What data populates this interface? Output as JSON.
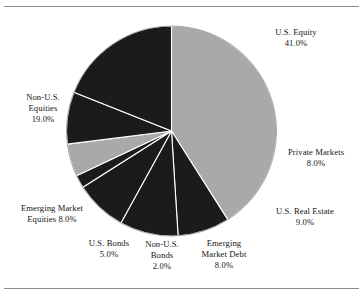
{
  "figure": {
    "name": "asset-allocation-pie-chart",
    "background_color": "#ffffff",
    "rule_color": "#8d8d8d"
  },
  "chart_data": {
    "type": "pie",
    "title": "",
    "subtitle": "",
    "xlabel": "",
    "ylabel": "",
    "legend_position": "none",
    "labels_placement": "outside-callout",
    "grid": false,
    "start_angle_deg": 0,
    "direction": "clockwise",
    "units": "percent",
    "total": 100.0,
    "categories": [
      "U.S. Equity",
      "Private Markets",
      "U.S. Real Estate",
      "Emerging Market Debt",
      "Non-U.S. Bonds",
      "U.S. Bonds",
      "Emerging Market Equities",
      "Non-U.S. Equities"
    ],
    "values": [
      41.0,
      8.0,
      9.0,
      8.0,
      2.0,
      5.0,
      8.0,
      19.0
    ],
    "value_labels": [
      "41.0%",
      "8.0%",
      "9.0%",
      "8.0%",
      "2.0%",
      "5.0%",
      "8.0%",
      "19.0%"
    ],
    "colors": [
      "#a9a9a9",
      "#1b1b1b",
      "#1b1b1b",
      "#1b1b1b",
      "#1b1b1b",
      "#a9a9a9",
      "#1b1b1b",
      "#1b1b1b"
    ],
    "slice_border_color": "#ffffff",
    "slices": [
      {
        "label": "U.S. Equity",
        "value": 41.0,
        "value_label": "41.0%",
        "color": "#a9a9a9",
        "label_lines": [
          "U.S. Equity",
          "41.0%"
        ]
      },
      {
        "label": "Private Markets",
        "value": 8.0,
        "value_label": "8.0%",
        "color": "#1b1b1b",
        "label_lines": [
          "Private Markets",
          "8.0%"
        ]
      },
      {
        "label": "U.S. Real Estate",
        "value": 9.0,
        "value_label": "9.0%",
        "color": "#1b1b1b",
        "label_lines": [
          "U.S. Real Estate",
          "9.0%"
        ]
      },
      {
        "label": "Emerging Market Debt",
        "value": 8.0,
        "value_label": "8.0%",
        "color": "#1b1b1b",
        "label_lines": [
          "Emerging",
          "Market Debt",
          "8.0%"
        ]
      },
      {
        "label": "Non-U.S. Bonds",
        "value": 2.0,
        "value_label": "2.0%",
        "color": "#1b1b1b",
        "label_lines": [
          "Non-U.S.",
          "Bonds",
          "2.0%"
        ]
      },
      {
        "label": "U.S. Bonds",
        "value": 5.0,
        "value_label": "5.0%",
        "color": "#a9a9a9",
        "label_lines": [
          "U.S. Bonds",
          "5.0%"
        ]
      },
      {
        "label": "Emerging Market Equities",
        "value": 8.0,
        "value_label": "8.0%",
        "color": "#1b1b1b",
        "label_lines": [
          "Emerging Market",
          "Equities 8.0%"
        ]
      },
      {
        "label": "Non-U.S. Equities",
        "value": 19.0,
        "value_label": "19.0%",
        "color": "#1b1b1b",
        "label_lines": [
          "Non-U.S.",
          "Equities",
          "19.0%"
        ]
      }
    ]
  },
  "labels": {
    "us_equity": "U.S. Equity\n41.0%",
    "private_markets": "Private Markets\n8.0%",
    "us_real_estate": "U.S. Real Estate\n9.0%",
    "em_debt": "Emerging\nMarket Debt\n8.0%",
    "non_us_bonds": "Non-U.S.\nBonds\n2.0%",
    "us_bonds": "U.S. Bonds\n5.0%",
    "em_equities": "Emerging Market\nEquities 8.0%",
    "non_us_equities": "Non-U.S.\nEquities\n19.0%"
  }
}
